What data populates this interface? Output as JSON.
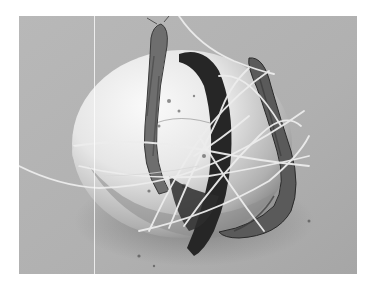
{
  "image": {
    "subject": "egg-shaped object bound with twine and root-like sticks",
    "style": "grayscale photograph",
    "colors": {
      "border": "#ffffff",
      "background": "#b3b3b3",
      "egg_highlight": "#f4f4f4",
      "egg_shadow": "#8a8a8a",
      "root_dark": "#2a2a2a",
      "root_mid": "#6e6e6e",
      "twine": "#ececec"
    }
  }
}
